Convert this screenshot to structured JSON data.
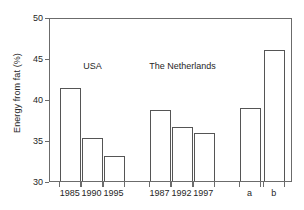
{
  "chart_data": {
    "type": "bar",
    "title": "",
    "xlabel": "",
    "ylabel": "Energy from fat (%)",
    "ylim": [
      30,
      50
    ],
    "yticks": [
      30,
      35,
      40,
      45,
      50
    ],
    "ytick_labels": [
      "30",
      "35",
      "40",
      "45",
      "50"
    ],
    "grid": false,
    "legend": false,
    "categories": [
      "1985",
      "1990",
      "1995",
      "1987",
      "1992",
      "1997",
      "a",
      "b"
    ],
    "values": [
      41.4,
      35.3,
      33.0,
      38.6,
      36.6,
      35.9,
      38.9,
      46.0
    ],
    "bars": [
      {
        "label": "1985",
        "value": 41.4,
        "group": "USA"
      },
      {
        "label": "1990",
        "value": 35.3,
        "group": "USA"
      },
      {
        "label": "1995",
        "value": 33.0,
        "group": "USA"
      },
      {
        "label": "1987",
        "value": 38.6,
        "group": "The Netherlands"
      },
      {
        "label": "1992",
        "value": 36.6,
        "group": "The Netherlands"
      },
      {
        "label": "1997",
        "value": 35.9,
        "group": "The Netherlands"
      },
      {
        "label": "a",
        "value": 38.9,
        "group": ""
      },
      {
        "label": "b",
        "value": 46.0,
        "group": ""
      }
    ],
    "annotations": [
      {
        "text": "USA",
        "x_frac": 0.175,
        "y_value": 44.2
      },
      {
        "text": "The Netherlands",
        "x_frac": 0.545,
        "y_value": 44.2
      }
    ]
  }
}
